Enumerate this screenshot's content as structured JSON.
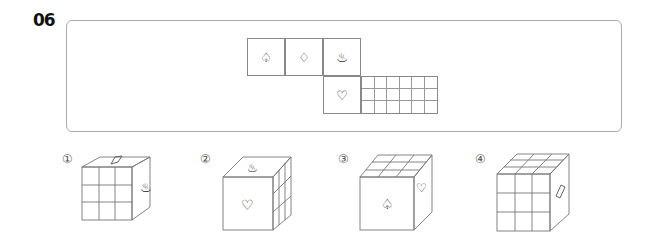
{
  "question": {
    "number": "06"
  },
  "net": {
    "faces": [
      {
        "id": "spade",
        "symbol": "♤"
      },
      {
        "id": "diamond",
        "symbol": "♢"
      },
      {
        "id": "hot-spring",
        "symbol": "♨"
      },
      {
        "id": "heart",
        "symbol": "♡"
      },
      {
        "id": "grid-a",
        "symbol": ""
      },
      {
        "id": "grid-b",
        "symbol": ""
      }
    ]
  },
  "options": [
    {
      "label": "①",
      "front": "grid",
      "top": "diamond",
      "right": "hot-spring"
    },
    {
      "label": "②",
      "front": "heart",
      "top": "hot-spring",
      "right": "grid"
    },
    {
      "label": "③",
      "front": "spade",
      "top": "grid",
      "right": "heart"
    },
    {
      "label": "④",
      "front": "grid",
      "top": "grid",
      "right": "diamond"
    }
  ],
  "colors": {
    "line": "#888888",
    "border": "#aaaaaa",
    "text": "#111111"
  }
}
